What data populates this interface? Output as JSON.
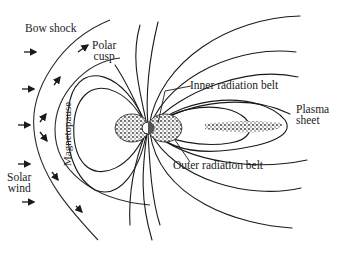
{
  "diagram": {
    "labels": {
      "bow_shock": "Bow shock",
      "polar_cusp_line1": "Polar",
      "polar_cusp_line2": "cusp",
      "magnetopause": "Magnetopause",
      "solar_wind_line1": "Solar",
      "solar_wind_line2": "wind",
      "inner_radiation_belt": "Inner radiation belt",
      "outer_radiation_belt": "Outer radiation belt",
      "plasma_sheet_line1": "Plasma",
      "plasma_sheet_line2": "sheet"
    },
    "colors": {
      "line": "#1a1a1a",
      "background": "#ffffff",
      "stipple": "#333333"
    },
    "solar_wind_arrows": 5,
    "icons": {
      "earth": "earth-circle",
      "arrow": "solar-wind-arrow"
    }
  }
}
